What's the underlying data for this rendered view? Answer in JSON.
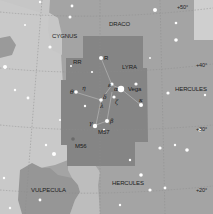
{
  "map": {
    "title": "Lyra star chart",
    "colors": {
      "background": "#a4a4a4",
      "light_region": "#c9c9c9",
      "lyra_region": "#858585",
      "vulpecula_region": "#969696",
      "upper_right_inset": "#cfcfcf",
      "gridline": "#8a8a8a",
      "star": "#ffffff",
      "label": "#1a1a1a"
    },
    "constellations": [
      {
        "name": "DRACO"
      },
      {
        "name": "CYGNUS"
      },
      {
        "name": "LYRA"
      },
      {
        "name": "HERCULES"
      },
      {
        "name": "HERCULES"
      },
      {
        "name": "VULPECULA"
      }
    ],
    "stars": [
      {
        "label": "Vega"
      },
      {
        "label": "α"
      },
      {
        "label": "ε"
      },
      {
        "label": "ζ"
      },
      {
        "label": "δ"
      },
      {
        "label": "β"
      },
      {
        "label": "γ"
      },
      {
        "label": "η"
      },
      {
        "label": "θ"
      },
      {
        "label": "κ"
      },
      {
        "label": "R"
      },
      {
        "label": "RR"
      },
      {
        "label": "λ"
      }
    ],
    "deep_sky": [
      {
        "label": "M56"
      },
      {
        "label": "M57"
      }
    ],
    "declination_ticks": [
      "+50°",
      "+40°",
      "+30°",
      "+20°"
    ]
  }
}
